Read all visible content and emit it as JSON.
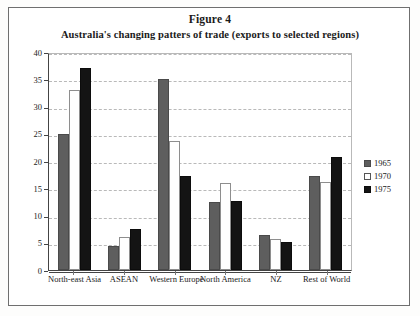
{
  "figure": {
    "title": "Figure 4",
    "subtitle": "Australia's changing patters of trade (exports to selected regions)"
  },
  "axis": {
    "ylabel": "as % of total exports",
    "yticks": [
      "40",
      "35",
      "30",
      "25",
      "20",
      "15",
      "10",
      "5",
      "0"
    ]
  },
  "legend": {
    "items": [
      {
        "label": "1965",
        "color": "#5e5e5e"
      },
      {
        "label": "1970",
        "color": "#ffffff"
      },
      {
        "label": "1975",
        "color": "#141414"
      }
    ]
  },
  "chart_data": {
    "type": "bar",
    "title": "Australia's changing patters of trade (exports to selected regions)",
    "xlabel": "",
    "ylabel": "as % of total exports",
    "ylim": [
      0,
      40
    ],
    "ytick_step": 5,
    "grid": true,
    "legend_position": "right",
    "categories": [
      "North-east Asia",
      "ASEAN",
      "Western Europe",
      "North America",
      "NZ",
      "Rest of World"
    ],
    "series": [
      {
        "name": "1965",
        "color": "#5e5e5e",
        "values": [
          25.0,
          4.4,
          35.0,
          12.4,
          6.4,
          17.2
        ]
      },
      {
        "name": "1970",
        "color": "#ffffff",
        "values": [
          33.0,
          6.0,
          23.7,
          16.0,
          5.6,
          16.2
        ]
      },
      {
        "name": "1975",
        "color": "#141414",
        "values": [
          37.0,
          7.6,
          17.2,
          12.6,
          5.1,
          20.8
        ]
      }
    ]
  }
}
